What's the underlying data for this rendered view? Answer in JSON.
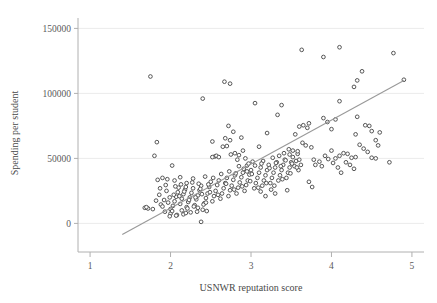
{
  "chart_data": {
    "type": "scatter",
    "title": "",
    "xlabel": "USNWR reputation score",
    "ylabel": "Spending per student",
    "xlim": [
      0.85,
      5.15
    ],
    "ylim": [
      -22000,
      158000
    ],
    "xticks": [
      1,
      2,
      3,
      4,
      5
    ],
    "xtick_labels": [
      "1",
      "2",
      "3",
      "4",
      "5"
    ],
    "yticks": [
      0,
      50000,
      100000,
      150000
    ],
    "ytick_labels": [
      "0",
      "50000",
      "100000",
      "150000"
    ],
    "grid": "horizontal",
    "legend": "none",
    "marker": "open-circle",
    "marker_color": "#4d4d4d",
    "marker_fill": "#ffffff",
    "line_color": "#999999",
    "axis_color": "#b0b0b0",
    "grid_color": "#ebebeb",
    "fit_line": {
      "label": "linear fit",
      "x": [
        1.4,
        4.9
      ],
      "y": [
        -8500,
        110000
      ]
    },
    "points": [
      [
        1.72,
        11500
      ],
      [
        1.78,
        11000
      ],
      [
        1.8,
        52000
      ],
      [
        1.75,
        113000
      ],
      [
        1.88,
        14500
      ],
      [
        1.9,
        13000
      ],
      [
        1.92,
        18000
      ],
      [
        1.86,
        22000
      ],
      [
        1.95,
        25000
      ],
      [
        1.97,
        16000
      ],
      [
        1.84,
        33500
      ],
      [
        1.9,
        35000
      ],
      [
        1.96,
        34000
      ],
      [
        1.99,
        20000
      ],
      [
        2.02,
        44500
      ],
      [
        2.0,
        11000
      ],
      [
        2.03,
        13500
      ],
      [
        2.05,
        17000
      ],
      [
        2.07,
        20500
      ],
      [
        2.09,
        24000
      ],
      [
        2.1,
        27500
      ],
      [
        2.12,
        15000
      ],
      [
        2.14,
        19000
      ],
      [
        2.16,
        22500
      ],
      [
        2.18,
        26000
      ],
      [
        2.2,
        12500
      ],
      [
        2.22,
        16500
      ],
      [
        2.24,
        20000
      ],
      [
        2.26,
        23500
      ],
      [
        2.28,
        27000
      ],
      [
        2.3,
        14000
      ],
      [
        2.32,
        18500
      ],
      [
        2.34,
        21500
      ],
      [
        2.36,
        25500
      ],
      [
        2.38,
        29000
      ],
      [
        2.4,
        10500
      ],
      [
        2.42,
        15500
      ],
      [
        2.44,
        19500
      ],
      [
        2.46,
        23000
      ],
      [
        2.48,
        28000
      ],
      [
        2.05,
        33000
      ],
      [
        2.12,
        35500
      ],
      [
        2.2,
        31000
      ],
      [
        2.28,
        34500
      ],
      [
        2.35,
        30500
      ],
      [
        2.43,
        36000
      ],
      [
        2.5,
        32000
      ],
      [
        2.38,
        1200
      ],
      [
        2.08,
        6500
      ],
      [
        2.16,
        7000
      ],
      [
        2.25,
        8500
      ],
      [
        2.33,
        9000
      ],
      [
        2.45,
        9500
      ],
      [
        1.93,
        9000
      ],
      [
        2.0,
        7500
      ],
      [
        2.52,
        17000
      ],
      [
        2.54,
        21000
      ],
      [
        2.56,
        25000
      ],
      [
        2.58,
        29500
      ],
      [
        2.6,
        33000
      ],
      [
        2.62,
        19000
      ],
      [
        2.64,
        23000
      ],
      [
        2.66,
        27000
      ],
      [
        2.68,
        31000
      ],
      [
        2.7,
        35000
      ],
      [
        2.72,
        21000
      ],
      [
        2.74,
        25500
      ],
      [
        2.76,
        29000
      ],
      [
        2.78,
        33500
      ],
      [
        2.8,
        37000
      ],
      [
        2.82,
        23000
      ],
      [
        2.84,
        27500
      ],
      [
        2.86,
        31500
      ],
      [
        2.88,
        35500
      ],
      [
        2.9,
        39000
      ],
      [
        2.92,
        25000
      ],
      [
        2.94,
        29500
      ],
      [
        2.96,
        33000
      ],
      [
        2.98,
        37500
      ],
      [
        3.0,
        41000
      ],
      [
        2.55,
        51500
      ],
      [
        2.57,
        52000
      ],
      [
        2.6,
        51000
      ],
      [
        2.65,
        59000
      ],
      [
        2.7,
        59500
      ],
      [
        2.75,
        53000
      ],
      [
        2.8,
        54000
      ],
      [
        2.85,
        52500
      ],
      [
        2.9,
        56000
      ],
      [
        2.95,
        44500
      ],
      [
        2.52,
        63000
      ],
      [
        2.68,
        65500
      ],
      [
        2.74,
        64000
      ],
      [
        2.78,
        70500
      ],
      [
        2.72,
        75000
      ],
      [
        2.88,
        66000
      ],
      [
        2.93,
        50000
      ],
      [
        2.83,
        49000
      ],
      [
        2.97,
        46000
      ],
      [
        3.02,
        47500
      ],
      [
        1.83,
        62500
      ],
      [
        2.4,
        96000
      ],
      [
        2.67,
        109000
      ],
      [
        2.74,
        107500
      ],
      [
        2.52,
        51000
      ],
      [
        3.04,
        27000
      ],
      [
        3.06,
        31000
      ],
      [
        3.08,
        35000
      ],
      [
        3.1,
        39000
      ],
      [
        3.12,
        43000
      ],
      [
        3.14,
        29000
      ],
      [
        3.16,
        33000
      ],
      [
        3.18,
        37000
      ],
      [
        3.2,
        41000
      ],
      [
        3.22,
        45000
      ],
      [
        3.24,
        31000
      ],
      [
        3.26,
        35000
      ],
      [
        3.28,
        39000
      ],
      [
        3.3,
        43000
      ],
      [
        3.32,
        47000
      ],
      [
        3.34,
        33000
      ],
      [
        3.36,
        37000
      ],
      [
        3.38,
        41000
      ],
      [
        3.4,
        45000
      ],
      [
        3.42,
        49000
      ],
      [
        3.44,
        35000
      ],
      [
        3.46,
        39000
      ],
      [
        3.48,
        43000
      ],
      [
        3.5,
        47000
      ],
      [
        3.52,
        51000
      ],
      [
        3.05,
        92500
      ],
      [
        3.1,
        59000
      ],
      [
        3.2,
        69500
      ],
      [
        3.33,
        83500
      ],
      [
        3.38,
        91000
      ],
      [
        3.12,
        24500
      ],
      [
        3.18,
        21000
      ],
      [
        3.25,
        26000
      ],
      [
        3.3,
        23000
      ],
      [
        3.45,
        25500
      ],
      [
        3.54,
        44000
      ],
      [
        3.56,
        48000
      ],
      [
        3.58,
        53500
      ],
      [
        3.6,
        49000
      ],
      [
        3.62,
        45000
      ],
      [
        3.64,
        62000
      ],
      [
        3.55,
        68500
      ],
      [
        3.6,
        74500
      ],
      [
        3.65,
        75500
      ],
      [
        3.7,
        73500
      ],
      [
        3.72,
        77000
      ],
      [
        3.68,
        60000
      ],
      [
        3.75,
        58500
      ],
      [
        3.78,
        49000
      ],
      [
        3.8,
        45000
      ],
      [
        3.72,
        32000
      ],
      [
        3.76,
        28000
      ],
      [
        3.52,
        56000
      ],
      [
        3.48,
        53000
      ],
      [
        3.58,
        55500
      ],
      [
        3.63,
        133500
      ],
      [
        3.9,
        128000
      ],
      [
        4.1,
        135500
      ],
      [
        4.77,
        131000
      ],
      [
        3.9,
        81000
      ],
      [
        3.95,
        78000
      ],
      [
        4.0,
        72500
      ],
      [
        4.05,
        80000
      ],
      [
        4.1,
        94000
      ],
      [
        4.0,
        56000
      ],
      [
        4.05,
        50000
      ],
      [
        4.1,
        52000
      ],
      [
        4.15,
        54000
      ],
      [
        4.2,
        53500
      ],
      [
        4.25,
        50500
      ],
      [
        4.3,
        51000
      ],
      [
        4.18,
        47000
      ],
      [
        4.23,
        45000
      ],
      [
        4.28,
        42000
      ],
      [
        4.12,
        39000
      ],
      [
        4.08,
        43000
      ],
      [
        4.02,
        46500
      ],
      [
        3.96,
        49500
      ],
      [
        3.92,
        52000
      ],
      [
        4.3,
        68500
      ],
      [
        4.32,
        82000
      ],
      [
        4.28,
        105000
      ],
      [
        4.32,
        110000
      ],
      [
        4.38,
        117000
      ],
      [
        4.42,
        75500
      ],
      [
        4.47,
        75000
      ],
      [
        4.5,
        71000
      ],
      [
        4.55,
        64000
      ],
      [
        4.6,
        70000
      ],
      [
        4.35,
        60500
      ],
      [
        4.4,
        57500
      ],
      [
        4.45,
        55000
      ],
      [
        4.5,
        50500
      ],
      [
        4.55,
        50000
      ],
      [
        4.58,
        60000
      ],
      [
        4.72,
        47000
      ],
      [
        4.9,
        110500
      ],
      [
        3.85,
        47500
      ],
      [
        3.88,
        44000
      ],
      [
        1.68,
        12000
      ],
      [
        1.7,
        12500
      ],
      [
        1.82,
        17500
      ],
      [
        1.87,
        27000
      ],
      [
        1.94,
        29500
      ],
      [
        2.06,
        28500
      ],
      [
        2.13,
        30000
      ],
      [
        2.19,
        28000
      ],
      [
        2.27,
        31500
      ],
      [
        2.37,
        26500
      ],
      [
        2.47,
        30000
      ],
      [
        2.53,
        35000
      ],
      [
        2.63,
        38000
      ],
      [
        2.73,
        40000
      ],
      [
        2.81,
        38500
      ],
      [
        2.91,
        42000
      ],
      [
        3.01,
        38000
      ],
      [
        3.15,
        48000
      ],
      [
        3.27,
        50500
      ],
      [
        3.35,
        52000
      ],
      [
        3.41,
        54000
      ],
      [
        3.47,
        57000
      ],
      [
        2.04,
        22000
      ],
      [
        2.11,
        21000
      ],
      [
        2.17,
        24500
      ],
      [
        2.23,
        18000
      ],
      [
        2.31,
        20000
      ],
      [
        2.39,
        22500
      ],
      [
        2.49,
        24000
      ],
      [
        2.59,
        22000
      ],
      [
        2.69,
        30500
      ],
      [
        2.79,
        26000
      ],
      [
        2.89,
        28500
      ],
      [
        2.99,
        32500
      ],
      [
        3.09,
        27500
      ],
      [
        3.19,
        31000
      ],
      [
        3.29,
        29000
      ],
      [
        3.39,
        34000
      ],
      [
        3.49,
        38500
      ],
      [
        3.59,
        41000
      ],
      [
        2.02,
        9500
      ],
      [
        2.14,
        10000
      ],
      [
        2.21,
        11500
      ],
      [
        2.29,
        13000
      ],
      [
        2.41,
        14500
      ],
      [
        1.99,
        5500
      ],
      [
        2.07,
        6000
      ],
      [
        2.19,
        8000
      ],
      [
        2.34,
        12000
      ],
      [
        2.44,
        16000
      ],
      [
        2.85,
        44000
      ],
      [
        2.95,
        40000
      ],
      [
        3.05,
        44500
      ],
      [
        3.13,
        46000
      ],
      [
        3.23,
        42500
      ],
      [
        3.31,
        46500
      ],
      [
        3.37,
        44000
      ],
      [
        3.43,
        48500
      ],
      [
        3.51,
        46000
      ],
      [
        3.57,
        43000
      ]
    ]
  },
  "axes": {
    "ylabel_text": "Spending per student",
    "xlabel_text": "USNWR reputation score"
  }
}
